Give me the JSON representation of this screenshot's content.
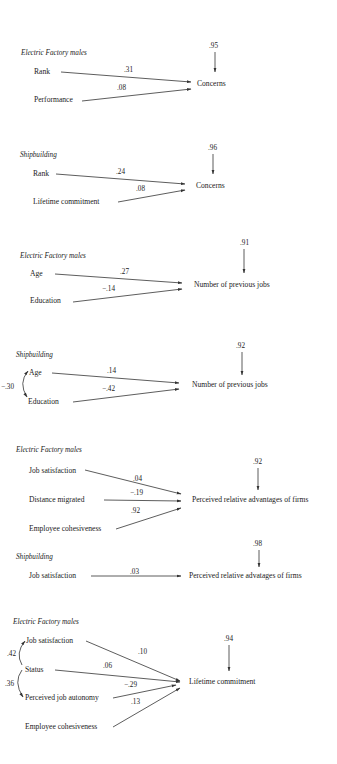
{
  "diagrams": [
    {
      "id": "d1",
      "heading": "Electric Factory males",
      "dependent": "Concerns",
      "residual": ".95",
      "predictors": [
        {
          "label": "Rank",
          "coef": ".31"
        },
        {
          "label": "Performance",
          "coef": ".08"
        }
      ],
      "correlations": []
    },
    {
      "id": "d2",
      "heading": "Shipbuilding",
      "dependent": "Concerns",
      "residual": ".96",
      "predictors": [
        {
          "label": "Rank",
          "coef": ".24"
        },
        {
          "label": "Lifetime commitment",
          "coef": ".08"
        }
      ],
      "correlations": []
    },
    {
      "id": "d3",
      "heading": "Electric Factory males",
      "dependent": "Number of previous jobs",
      "residual": ".91",
      "predictors": [
        {
          "label": "Age",
          "coef": ".27"
        },
        {
          "label": "Education",
          "coef": "−.14"
        }
      ],
      "correlations": []
    },
    {
      "id": "d4",
      "heading": "Shipbuilding",
      "dependent": "Number of previous jobs",
      "residual": ".92",
      "predictors": [
        {
          "label": "Age",
          "coef": ".14"
        },
        {
          "label": "Education",
          "coef": "−.42"
        }
      ],
      "correlations": [
        {
          "between": [
            "Age",
            "Education"
          ],
          "value": "−.30"
        }
      ]
    },
    {
      "id": "d5",
      "heading": "Electric Factory males",
      "dependent": "Perceived relative advantages of firms",
      "residual": ".92",
      "predictors": [
        {
          "label": "Job satisfaction",
          "coef": ".04"
        },
        {
          "label": "Distance migrated",
          "coef": "−.19"
        },
        {
          "label": "Employee cohesiveness",
          "coef": ".92"
        }
      ],
      "correlations": []
    },
    {
      "id": "d6",
      "heading": "Shipbuilding",
      "dependent": "Perceived relative advatages of firms",
      "residual": ".98",
      "predictors": [
        {
          "label": "Job satisfaction",
          "coef": ".03"
        }
      ],
      "correlations": []
    },
    {
      "id": "d7",
      "heading": "Electric Factory males",
      "dependent": "Lifetime commitment",
      "residual": ".94",
      "predictors": [
        {
          "label": "Job satisfaction",
          "coef": ".10"
        },
        {
          "label": "Status",
          "coef": ".06"
        },
        {
          "label": "Perceived job autonomy",
          "coef": "−.29"
        },
        {
          "label": "Employee cohesiveness",
          "coef": ".13"
        }
      ],
      "correlations": [
        {
          "between": [
            "Job satisfaction",
            "Status"
          ],
          "value": ".42"
        },
        {
          "between": [
            "Status",
            "Perceived job autonomy"
          ],
          "value": ".36"
        }
      ]
    }
  ]
}
